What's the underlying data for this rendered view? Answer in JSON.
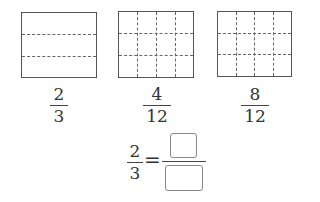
{
  "models": [
    {
      "columns": 1,
      "rows": 3,
      "fraction": {
        "numerator": "2",
        "denominator": "3"
      }
    },
    {
      "columns": 4,
      "rows": 3,
      "fraction": {
        "numerator": "4",
        "denominator": "12"
      }
    },
    {
      "columns": 4,
      "rows": 3,
      "fraction": {
        "numerator": "8",
        "denominator": "12"
      }
    }
  ],
  "equation": {
    "left": {
      "numerator": "2",
      "denominator": "3"
    },
    "equals": "=",
    "right": {
      "numerator": "",
      "denominator": ""
    }
  },
  "colors": {
    "border": "#555555",
    "dashed": "#666666",
    "answer_box": "#888888"
  }
}
